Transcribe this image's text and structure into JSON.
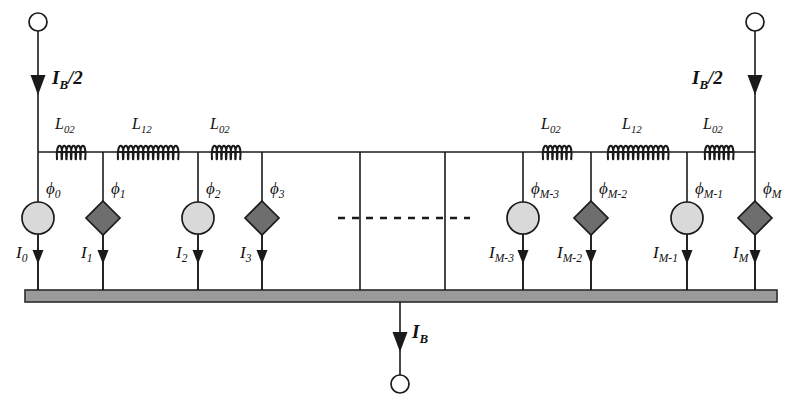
{
  "figure": {
    "kind": "circuit-schematic",
    "colors": {
      "line": "#1a1a1a",
      "circle_fill": "#d9d9d9",
      "diamond_fill": "#6e6e6e",
      "ground_fill": "#9a9a9a",
      "ground_border": "#2b2b2b",
      "background": "#ffffff"
    }
  },
  "terminals": {
    "top_left": {
      "name": "top-left-terminal",
      "bias_label": "I",
      "bias_sub": "B",
      "bias_tail": "/2"
    },
    "top_right": {
      "name": "top-right-terminal",
      "bias_label": "I",
      "bias_sub": "B",
      "bias_tail": "/2"
    },
    "bottom": {
      "name": "bottom-terminal",
      "bias_label": "I",
      "bias_sub": "B",
      "bias_tail": ""
    }
  },
  "inductors": [
    {
      "id": "L-left-1",
      "label": "L",
      "sub": "02",
      "x": 71,
      "turns": 6,
      "span": 28
    },
    {
      "id": "L-left-2",
      "label": "L",
      "sub": "12",
      "x": 148,
      "turns": 12,
      "span": 60
    },
    {
      "id": "L-left-3",
      "label": "L",
      "sub": "02",
      "x": 226,
      "turns": 6,
      "span": 28
    },
    {
      "id": "L-right-1",
      "label": "L",
      "sub": "02",
      "x": 557,
      "turns": 6,
      "span": 28
    },
    {
      "id": "L-right-2",
      "label": "L",
      "sub": "12",
      "x": 638,
      "turns": 12,
      "span": 60
    },
    {
      "id": "L-right-3",
      "label": "L",
      "sub": "02",
      "x": 719,
      "turns": 6,
      "span": 28
    }
  ],
  "branches": [
    {
      "id": "branch-0",
      "x": 38,
      "element": "circle",
      "flux": {
        "label": "ϕ",
        "sub": "0"
      },
      "current": {
        "label": "I",
        "sub": "0"
      }
    },
    {
      "id": "branch-1",
      "x": 103,
      "element": "diamond",
      "flux": {
        "label": "ϕ",
        "sub": "1"
      },
      "current": {
        "label": "I",
        "sub": "1"
      }
    },
    {
      "id": "branch-2",
      "x": 198,
      "element": "circle",
      "flux": {
        "label": "ϕ",
        "sub": "2"
      },
      "current": {
        "label": "I",
        "sub": "2"
      }
    },
    {
      "id": "branch-3",
      "x": 262,
      "element": "diamond",
      "flux": {
        "label": "ϕ",
        "sub": "3"
      },
      "current": {
        "label": "I",
        "sub": "3"
      }
    },
    {
      "id": "branch-M-3",
      "x": 523,
      "element": "circle",
      "flux": {
        "label": "ϕ",
        "sub": "M-3"
      },
      "current": {
        "label": "I",
        "sub": "M-3"
      }
    },
    {
      "id": "branch-M-2",
      "x": 591,
      "element": "diamond",
      "flux": {
        "label": "ϕ",
        "sub": "M-2"
      },
      "current": {
        "label": "I",
        "sub": "M-2"
      }
    },
    {
      "id": "branch-M-1",
      "x": 687,
      "element": "circle",
      "flux": {
        "label": "ϕ",
        "sub": "M-1"
      },
      "current": {
        "label": "I",
        "sub": "M-1"
      }
    },
    {
      "id": "branch-M",
      "x": 755,
      "element": "diamond",
      "flux": {
        "label": "ϕ",
        "sub": "M"
      },
      "current": {
        "label": "I",
        "sub": "M"
      }
    }
  ],
  "plain_branches": [
    {
      "id": "plain-branch-a",
      "x": 360
    },
    {
      "id": "plain-branch-b",
      "x": 445
    }
  ],
  "ellipsis": {
    "id": "continuation-dashes",
    "x1": 338,
    "x2": 470,
    "y": 218
  },
  "geometry": {
    "rail_y": 152,
    "ground_top": 290,
    "ground_bottom": 302,
    "ground_left": 25,
    "ground_right": 777,
    "element_cy": 218,
    "terminal_r": 9,
    "circle_r": 16,
    "diamond_r": 17
  }
}
